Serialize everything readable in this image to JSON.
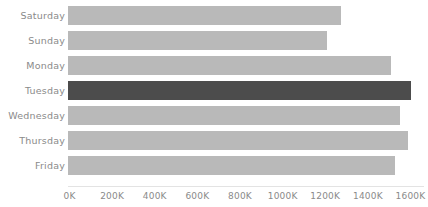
{
  "chart_data": {
    "type": "bar",
    "orientation": "horizontal",
    "title": "",
    "subtitle": "",
    "xlabel": "",
    "ylabel": "",
    "grid": false,
    "legend": "none",
    "categories": [
      "Saturday",
      "Sunday",
      "Monday",
      "Tuesday",
      "Wednesday",
      "Thursday",
      "Friday"
    ],
    "values": [
      1275000,
      1210000,
      1510000,
      1600000,
      1553000,
      1590000,
      1529000
    ],
    "value_labels": [
      "1275K",
      "1210K",
      "1510K",
      "1600K",
      "1553K",
      "1590K",
      "1529K"
    ],
    "highlight_category": "Tuesday",
    "xlim": [
      0,
      1600000
    ],
    "x_ticks": [
      0,
      200000,
      400000,
      600000,
      800000,
      1000000,
      1200000,
      1400000,
      1600000
    ],
    "x_tick_labels": [
      "0K",
      "200K",
      "400K",
      "600K",
      "800K",
      "1000K",
      "1200K",
      "1400K",
      "1600K"
    ],
    "colors": {
      "bar": "#b9b9b9",
      "bar_highlight": "#4c4c4c",
      "text": "#8a8a8a",
      "axis_line": "#e3e3e3",
      "background": "#ffffff"
    }
  }
}
